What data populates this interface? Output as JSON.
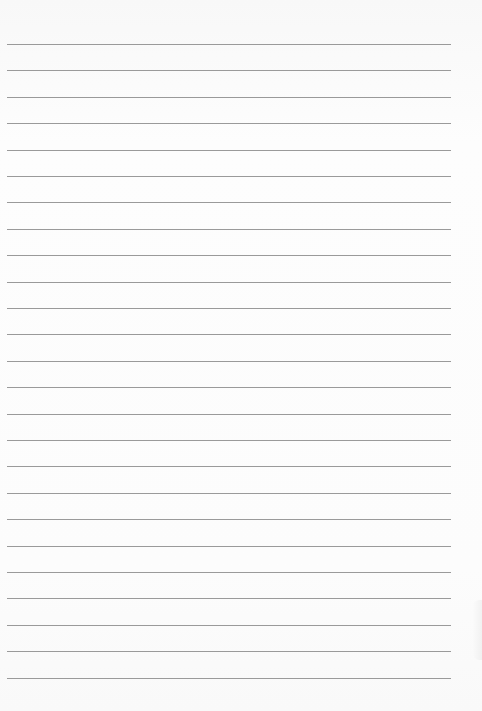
{
  "page": {
    "type": "lined-paper",
    "background_color": "#fbfbfb",
    "line_color": "#9a9a9a",
    "line_count": 25,
    "first_line_y": 44,
    "line_spacing": 26.4,
    "line_left": 7,
    "line_right": 451
  }
}
